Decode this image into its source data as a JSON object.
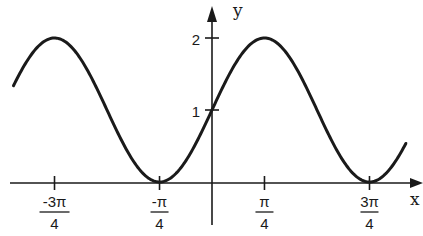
{
  "chart_data": {
    "type": "line",
    "title": "",
    "function": "y = 1 + sin(2x)",
    "xlabel": "x",
    "ylabel": "y",
    "x_ticks": [
      {
        "value": -2.356,
        "num": "-3π",
        "den": "4"
      },
      {
        "value": -0.785,
        "num": "-π",
        "den": "4"
      },
      {
        "value": 0.785,
        "num": "π",
        "den": "4"
      },
      {
        "value": 2.356,
        "num": "3π",
        "den": "4"
      }
    ],
    "y_ticks": [
      {
        "value": 1,
        "label": "1"
      },
      {
        "value": 2,
        "label": "2"
      }
    ],
    "xlim": [
      -3.05,
      3.0
    ],
    "ylim": [
      0,
      2
    ],
    "grid": false,
    "legend": null,
    "key_points": [
      {
        "x": -2.356,
        "y": 2,
        "note": "maximum"
      },
      {
        "x": -0.785,
        "y": 0,
        "note": "minimum"
      },
      {
        "x": 0,
        "y": 1,
        "note": "y-intercept"
      },
      {
        "x": 0.785,
        "y": 2,
        "note": "maximum"
      },
      {
        "x": 2.356,
        "y": 0,
        "note": "minimum"
      }
    ],
    "line_color": "#1a1a1a"
  },
  "axes": {
    "x_label": "x",
    "y_label": "y"
  }
}
